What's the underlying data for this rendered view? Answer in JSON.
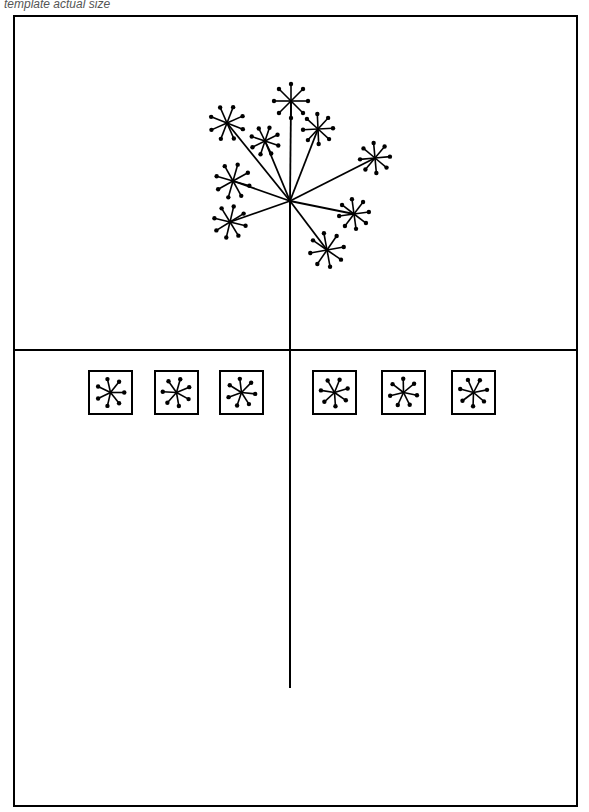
{
  "caption": "template actual size",
  "colors": {
    "ink": "#000000",
    "background": "#ffffff"
  },
  "frame": {
    "x": 14,
    "y": 16,
    "width": 563,
    "height": 790,
    "divider_y": 350
  },
  "stem": {
    "x": 290,
    "top": 201,
    "bottom": 688
  },
  "hub": {
    "x": 290,
    "y": 201
  },
  "umbels": [
    {
      "x": 291,
      "y": 101,
      "r": 17
    },
    {
      "x": 227,
      "y": 123,
      "r": 17
    },
    {
      "x": 318,
      "y": 129,
      "r": 15
    },
    {
      "x": 265,
      "y": 141,
      "r": 14
    },
    {
      "x": 375,
      "y": 158,
      "r": 15
    },
    {
      "x": 233,
      "y": 181,
      "r": 17
    },
    {
      "x": 354,
      "y": 214,
      "r": 15
    },
    {
      "x": 230,
      "y": 222,
      "r": 16
    },
    {
      "x": 327,
      "y": 250,
      "r": 17
    }
  ],
  "tiles": [
    {
      "x": 89,
      "y": 371,
      "size": 43
    },
    {
      "x": 155,
      "y": 371,
      "size": 43
    },
    {
      "x": 220,
      "y": 371,
      "size": 43
    },
    {
      "x": 313,
      "y": 371,
      "size": 43
    },
    {
      "x": 382,
      "y": 371,
      "size": 43
    },
    {
      "x": 452,
      "y": 371,
      "size": 43
    }
  ]
}
